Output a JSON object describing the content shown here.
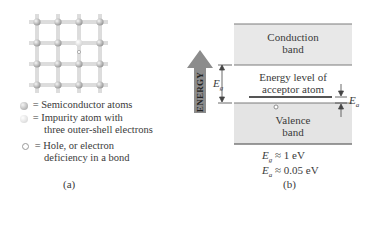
{
  "panel_a": {
    "lattice": {
      "rows": 4,
      "cols": 4,
      "impurity_row": 1,
      "impurity_col": 2,
      "hole_marker": "o"
    },
    "legend": [
      {
        "icon": "semiconductor-atom-icon",
        "symbol": "=",
        "text": "Semiconductor atoms"
      },
      {
        "icon": "impurity-atom-icon",
        "symbol": "=",
        "text_line1": "Impurity atom with",
        "text_line2": "three outer-shell electrons"
      },
      {
        "icon": "hole-icon",
        "symbol": "=",
        "text_line1": "Hole, or electron",
        "text_line2": "deficiency in a bond"
      }
    ],
    "caption": "(a)"
  },
  "panel_b": {
    "energy_arrow_label": "ENERGY",
    "conduction_band": {
      "line1": "Conduction",
      "line2": "band"
    },
    "acceptor_level": {
      "line1": "Energy level of",
      "line2": "acceptor atom"
    },
    "valence_band": {
      "line1": "Valence",
      "line2": "band"
    },
    "eg_label": "E",
    "eg_sub": "g",
    "ea_label": "E",
    "ea_sub": "a",
    "eq1": {
      "sym": "E",
      "sub": "g",
      "rel": "≈",
      "value": "1 eV"
    },
    "eq2": {
      "sym": "E",
      "sub": "a",
      "rel": "≈",
      "value": "0.05 eV"
    },
    "caption": "(b)",
    "colors": {
      "band_fill": "#e6e6e6",
      "arrow_fill": "#8a8a8a",
      "line": "#6a6a6a"
    }
  }
}
